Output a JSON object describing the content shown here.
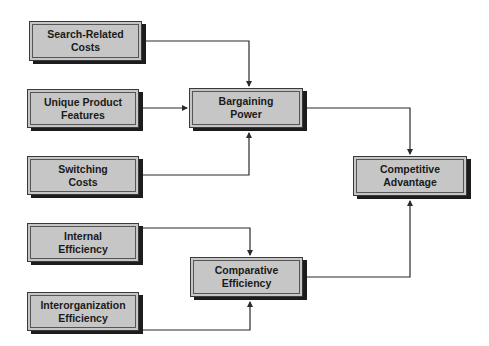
{
  "diagram": {
    "nodes": [
      {
        "id": "search_costs",
        "label": "Search-Related\nCosts"
      },
      {
        "id": "unique_features",
        "label": "Unique Product\nFeatures"
      },
      {
        "id": "switching_costs",
        "label": "Switching\nCosts"
      },
      {
        "id": "internal_eff",
        "label": "Internal\nEfficiency"
      },
      {
        "id": "interorg_eff",
        "label": "Interorganization\nEfficiency"
      },
      {
        "id": "bargaining_power",
        "label": "Bargaining\nPower"
      },
      {
        "id": "comparative_eff",
        "label": "Comparative\nEfficiency"
      },
      {
        "id": "competitive_adv",
        "label": "Competitive\nAdvantage"
      }
    ],
    "edges": [
      {
        "from": "search_costs",
        "to": "bargaining_power"
      },
      {
        "from": "unique_features",
        "to": "bargaining_power"
      },
      {
        "from": "switching_costs",
        "to": "bargaining_power"
      },
      {
        "from": "internal_eff",
        "to": "comparative_eff"
      },
      {
        "from": "interorg_eff",
        "to": "comparative_eff"
      },
      {
        "from": "bargaining_power",
        "to": "competitive_adv"
      },
      {
        "from": "comparative_eff",
        "to": "competitive_adv"
      }
    ],
    "colors": {
      "box_fill": "#c6c6c6",
      "box_border": "#3a3a3a",
      "shadow": "#1c1c1c",
      "line": "#2a2a2a"
    }
  }
}
